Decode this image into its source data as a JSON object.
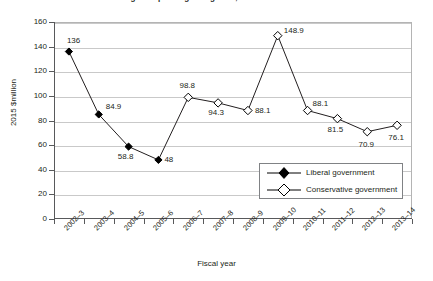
{
  "chart_data": {
    "type": "line",
    "title": "Figure: Spending on legal aid, 2002–3 to 2013–14",
    "xlabel": "Fiscal year",
    "ylabel": "2015 $million",
    "ylim": [
      0,
      160
    ],
    "ytick_step": 20,
    "yticks": [
      0,
      20,
      40,
      60,
      80,
      100,
      120,
      140,
      160
    ],
    "ytick_labels": [
      "0",
      "20",
      "40",
      "60",
      "80",
      "100",
      "120",
      "140",
      "160"
    ],
    "grid": "horizontal",
    "legend_position": "inside-lower-right",
    "categories": [
      "2002–3",
      "2003–4",
      "2004–5",
      "2005–6",
      "2006–7",
      "2007–8",
      "2008–9",
      "2009–10",
      "2010–11",
      "2011–12",
      "2012–13",
      "2013–14"
    ],
    "series": [
      {
        "name": "Liberal government",
        "marker": "filled-diamond",
        "color": "#000000",
        "values": [
          136,
          84.9,
          58.8,
          48,
          null,
          null,
          null,
          null,
          null,
          null,
          null,
          null
        ],
        "labels": [
          "136",
          "84.9",
          "58.8",
          "48",
          "",
          "",
          "",
          "",
          "",
          "",
          "",
          ""
        ]
      },
      {
        "name": "Conservative government",
        "marker": "hollow-diamond",
        "color": "#000000",
        "values": [
          null,
          null,
          null,
          null,
          98.8,
          94.3,
          88.1,
          148.9,
          88.1,
          81.5,
          70.9,
          76.1
        ],
        "labels": [
          "",
          "",
          "",
          "",
          "98.8",
          "94.3",
          "88.1",
          "148.9",
          "88.1",
          "81.5",
          "70.9",
          "76.1"
        ]
      }
    ],
    "all_values": [
      136,
      84.9,
      58.8,
      48,
      98.8,
      94.3,
      88.1,
      148.9,
      88.1,
      81.5,
      70.9,
      76.1
    ],
    "all_labels": [
      "136",
      "84.9",
      "58.8",
      "48",
      "98.8",
      "94.3",
      "88.1",
      "148.9",
      "88.1",
      "81.5",
      "70.9",
      "76.1"
    ]
  },
  "legend": {
    "items": [
      {
        "label": "Liberal government",
        "marker": "filled-diamond"
      },
      {
        "label": "Conservative government",
        "marker": "hollow-diamond"
      }
    ]
  }
}
